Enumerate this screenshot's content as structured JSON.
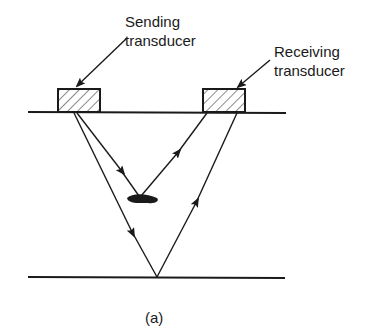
{
  "labels": {
    "sending_line1": "Sending",
    "sending_line2": "transducer",
    "receiving_line1": "Receiving",
    "receiving_line2": "transducer",
    "caption": "(a)"
  },
  "colors": {
    "ink": "#1a1a1a",
    "background": "#ffffff"
  },
  "elements": {
    "top_surface": "top-surface-line",
    "bottom_surface": "back-wall-line",
    "sending_transducer": "hatched-rectangle",
    "receiving_transducer": "hatched-rectangle",
    "defect": "elliptical-flaw",
    "paths": [
      "defect-echo-path",
      "back-wall-echo-path"
    ]
  }
}
